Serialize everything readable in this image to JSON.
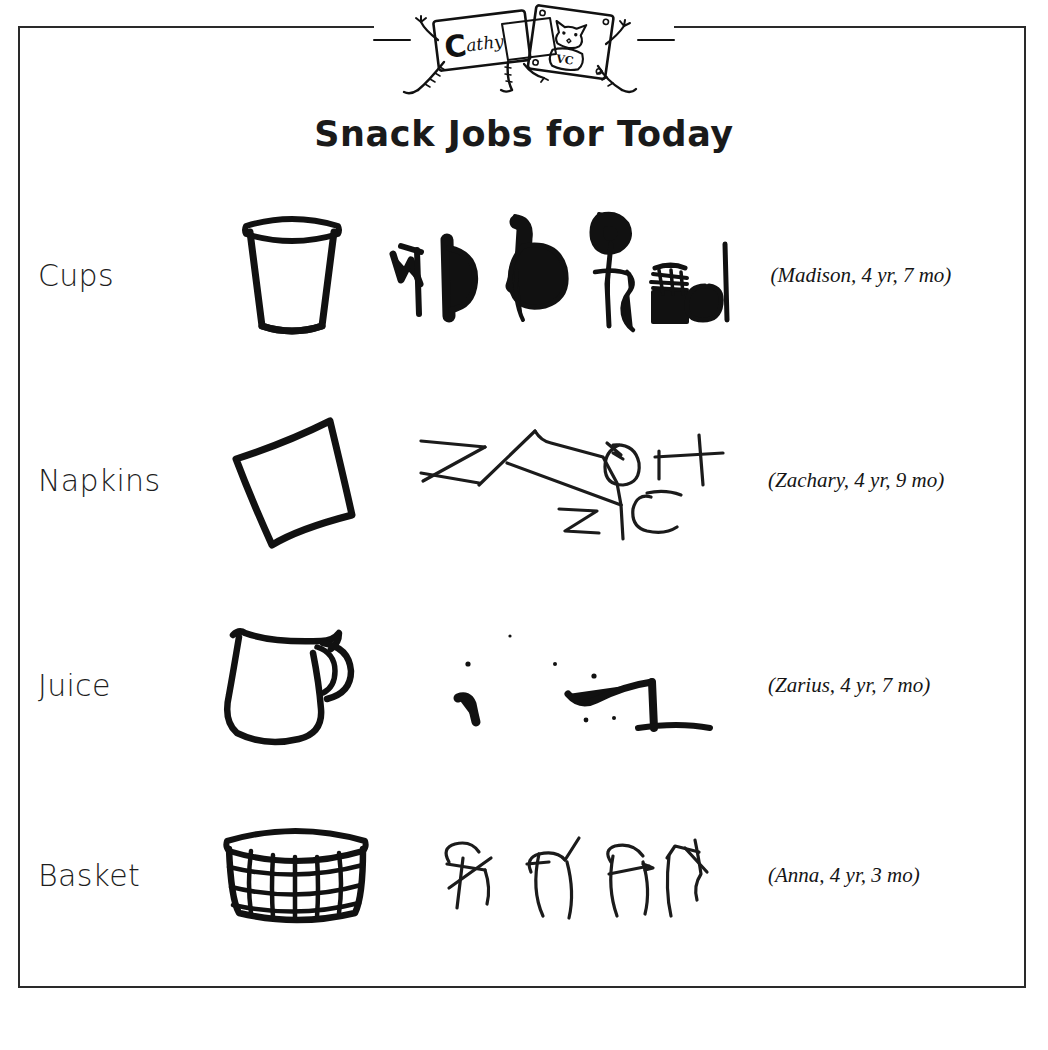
{
  "page": {
    "title": "Snack Jobs for Today",
    "logo_wordmark": "Cathy",
    "logo_cat_label": "VC",
    "border_color": "#2a2a2a",
    "ink_color": "#111111",
    "background_color": "#ffffff"
  },
  "rows": [
    {
      "label": "Cups",
      "object_icon": "cup-icon",
      "writing_sample_icon": "handwriting-madison",
      "caption": "(Madison, 4 yr, 7 mo)",
      "child_name": "Madison",
      "age_years": "4 yr",
      "age_months": "7 mo"
    },
    {
      "label": "Napkins",
      "object_icon": "napkin-icon",
      "writing_sample_icon": "handwriting-zachary",
      "caption": "(Zachary, 4 yr, 9 mo)",
      "child_name": "Zachary",
      "age_years": "4 yr",
      "age_months": "9 mo"
    },
    {
      "label": "Juice",
      "object_icon": "pitcher-icon",
      "writing_sample_icon": "handwriting-zarius",
      "caption": "(Zarius, 4 yr, 7 mo)",
      "child_name": "Zarius",
      "age_years": "4 yr",
      "age_months": "7 mo"
    },
    {
      "label": "Basket",
      "object_icon": "basket-icon",
      "writing_sample_icon": "handwriting-anna",
      "caption": "(Anna, 4 yr, 3 mo)",
      "child_name": "Anna",
      "age_years": "4 yr",
      "age_months": "3 mo"
    }
  ]
}
